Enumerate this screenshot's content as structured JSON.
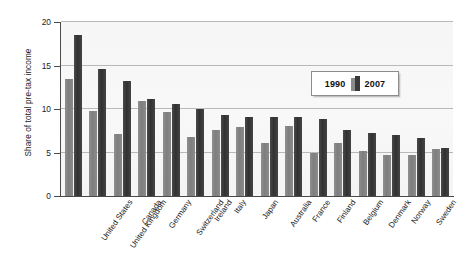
{
  "chart_data": {
    "type": "bar",
    "title": "",
    "xlabel": "",
    "ylabel": "Share of total pre-tax income",
    "ylim": [
      0,
      20
    ],
    "yticks": [
      0,
      5,
      10,
      15,
      20
    ],
    "ytick_labels": [
      "0",
      "5",
      "10",
      "15",
      "20"
    ],
    "grid": true,
    "grid_axis": "y",
    "legend_position": "upper-right-inside",
    "categories": [
      "United States",
      "United Kingdom",
      "Canada",
      "Germany",
      "Switzerland",
      "Ireland",
      "Italy",
      "Japan",
      "Australia",
      "France",
      "Finland",
      "Belgium",
      "Denmark",
      "Norway",
      "Sweden",
      "Netherlands"
    ],
    "series": [
      {
        "name": "1990",
        "color": "#8b8b8b",
        "values": [
          13.5,
          9.8,
          7.1,
          10.9,
          9.7,
          6.8,
          7.6,
          7.9,
          6.1,
          8.1,
          4.9,
          6.1,
          5.2,
          4.7,
          4.7,
          5.4
        ]
      },
      {
        "name": "2007",
        "color": "#3a3a3a",
        "values": [
          18.5,
          14.6,
          13.2,
          11.1,
          10.6,
          10.0,
          9.3,
          9.1,
          9.1,
          9.1,
          8.9,
          7.6,
          7.2,
          7.0,
          6.7,
          5.5
        ]
      }
    ]
  },
  "legend": {
    "label_1990": "1990",
    "label_2007": "2007"
  },
  "colors": {
    "bar_1990": "#8b8b8b",
    "bar_2007": "#3a3a3a",
    "plot_background": "#f7f7f7",
    "gridline": "#b9b9b9",
    "axis": "#4a4a4a",
    "text": "#1b1b1b"
  }
}
